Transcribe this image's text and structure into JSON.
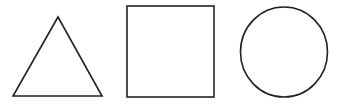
{
  "figure": {
    "width": 343,
    "height": 107,
    "background": "#ffffff",
    "stroke_color": "#222222",
    "stroke_width": 1.6,
    "shapes": [
      {
        "type": "triangle",
        "name": "triangle",
        "points": [
          [
            58,
            17
          ],
          [
            102,
            96
          ],
          [
            13,
            96
          ]
        ]
      },
      {
        "type": "square",
        "name": "square",
        "x": 127,
        "y": 6,
        "width": 87,
        "height": 91
      },
      {
        "type": "circle",
        "name": "circle",
        "cx": 284,
        "cy": 52,
        "rx": 43.5,
        "ry": 45
      }
    ]
  }
}
